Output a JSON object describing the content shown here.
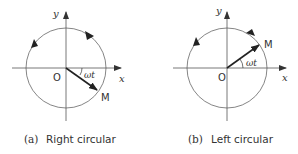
{
  "panels": [
    {
      "id": "a",
      "caption_tag": "(a)",
      "caption_text": "Right circular",
      "axis_x_label": "x",
      "axis_y_label": "y",
      "origin_label": "O",
      "point_label": "M",
      "angle_label": "ωt",
      "rotation": "clockwise"
    },
    {
      "id": "b",
      "caption_tag": "(b)",
      "caption_text": "Left circular",
      "axis_x_label": "x",
      "axis_y_label": "y",
      "origin_label": "O",
      "point_label": "M",
      "angle_label": "ωt",
      "rotation": "counterclockwise"
    }
  ],
  "colors": {
    "line": "#555555",
    "arrow": "#222222",
    "text": "#333333"
  }
}
